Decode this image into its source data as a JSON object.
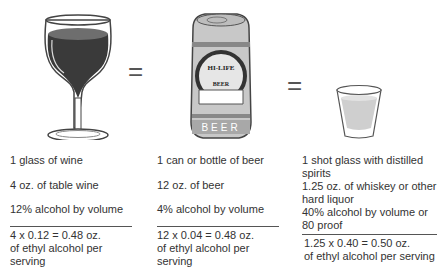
{
  "equals_sign": "=",
  "drinks": [
    {
      "name": "wine",
      "icon": "wine-glass-icon",
      "serving": "1 glass of wine",
      "amount": "4 oz. of table wine",
      "abv": "12% alcohol by volume",
      "calc": "4 x 0.12 = 0.48 oz.",
      "result": "of ethyl alcohol per serving"
    },
    {
      "name": "beer",
      "icon": "beer-can-icon",
      "can_label_top": "HI-LIFE",
      "can_label_mid": "BEER",
      "can_label_band": "BEER",
      "serving": "1 can or bottle of beer",
      "amount": "12 oz. of beer",
      "abv": "4% alcohol by volume",
      "calc": "12 x 0.04 = 0.48 oz.",
      "result": "of ethyl alcohol per serving"
    },
    {
      "name": "spirits",
      "icon": "shot-glass-icon",
      "serving_line1": "1 shot glass with distilled",
      "serving_line2": "spirits",
      "amount_line1": "1.25 oz. of whiskey or other",
      "amount_line2": "hard liquor",
      "abv_line1": "40% alcohol by volume or",
      "abv_line2": "80 proof",
      "calc": "1.25 x 0.40 = 0.50 oz.",
      "result": "of ethyl alcohol per serving"
    }
  ],
  "colors": {
    "wine": "#3a3a3a",
    "wine_top": "#6e6e6e",
    "can_body": "#c8c8c8",
    "shot_liquid": "#cfcfcf"
  }
}
